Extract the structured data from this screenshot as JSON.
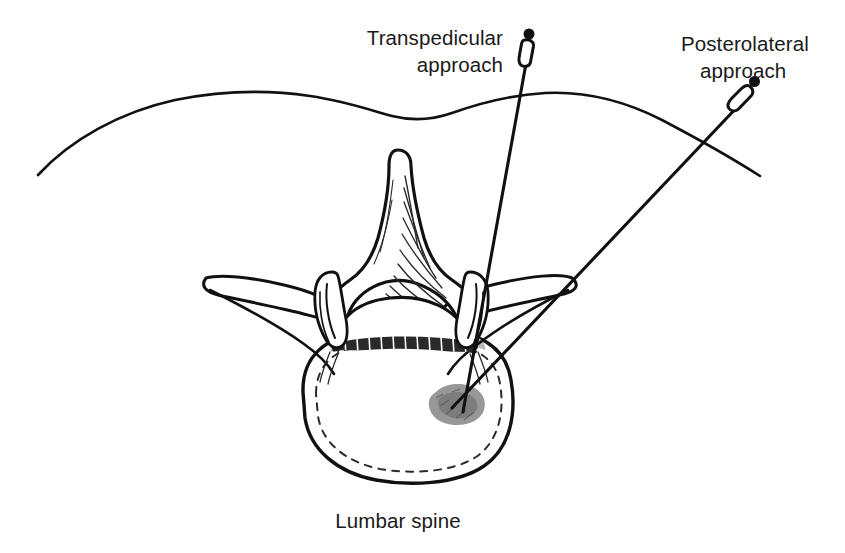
{
  "figure": {
    "title_caption": "Lumbar spine",
    "background_color": "#ffffff",
    "ink_color": "#111111",
    "lesion_color": "#8c8c8c",
    "width": 845,
    "height": 553
  },
  "labels": {
    "transpedicular": {
      "line1": "Transpedicular",
      "line2": "approach",
      "name": "transpedicular-approach-label"
    },
    "posterolateral": {
      "line1": "Posterolateral",
      "line2": "approach",
      "name": "posterolateral-approach-label"
    }
  },
  "caption": {
    "text": "Lumbar spine"
  },
  "anatomy": {
    "skin_line_name": "skin-surface-line",
    "spinous_process": "spinous-process",
    "transverse_process_left": "left-transverse-process",
    "transverse_process_right": "right-transverse-process",
    "superior_articular_left": "left-superior-articular-process",
    "superior_articular_right": "right-superior-articular-process",
    "vertebral_foramen": "vertebral-foramen",
    "vertebral_body": "vertebral-body",
    "lesion": "cement-lesion-target"
  },
  "needles": {
    "transpedicular": {
      "name": "transpedicular-needle",
      "hub_x": 530,
      "hub_y": 35,
      "tip_x": 463,
      "tip_y": 412
    },
    "posterolateral": {
      "name": "posterolateral-needle",
      "hub_x": 750,
      "hub_y": 90,
      "tip_x": 452,
      "tip_y": 408
    }
  }
}
